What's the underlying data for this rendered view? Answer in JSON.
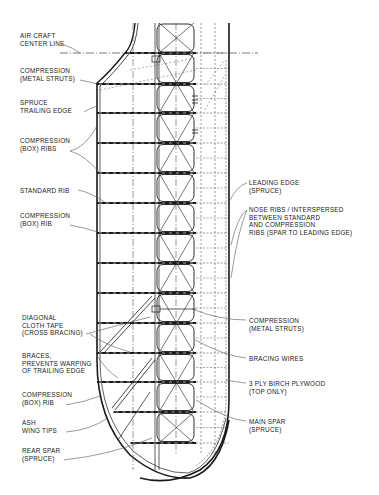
{
  "diagram": {
    "colors": {
      "ink": "#1a1a1a",
      "light_ink": "#555555",
      "background": "#ffffff"
    },
    "labels_left": [
      {
        "id": "aircraft-center-line",
        "text": "AIR CRAFT\nCENTER LINE",
        "x": 20,
        "y": 32
      },
      {
        "id": "compression-metal-struts-top",
        "text": "COMPRESSION\n(METAL STRUTS)",
        "x": 20,
        "y": 67
      },
      {
        "id": "spruce-trailing-edge",
        "text": "SPRUCE\nTRAILING EDGE",
        "x": 20,
        "y": 99
      },
      {
        "id": "compression-box-ribs",
        "text": "COMPRESSION\n(BOX) RIBS",
        "x": 20,
        "y": 137
      },
      {
        "id": "standard-rib",
        "text": "STANDARD RIB",
        "x": 20,
        "y": 187
      },
      {
        "id": "compression-box-rib-upper",
        "text": "COMPRESSION\n(BOX) RIB",
        "x": 20,
        "y": 212
      },
      {
        "id": "diagonal-cloth-tape",
        "text": "DIAGONAL\nCLOTH TAPE\n(CROSS BRACING)",
        "x": 22,
        "y": 314
      },
      {
        "id": "braces-trailing-edge",
        "text": "BRACES,\nPREVENTS WARPING\nOF TRAILING EDGE",
        "x": 22,
        "y": 352
      },
      {
        "id": "compression-box-rib-lower",
        "text": "COMPRESSION\n(BOX) RIB",
        "x": 22,
        "y": 391
      },
      {
        "id": "ash-wing-tips",
        "text": "ASH\nWING TIPS",
        "x": 22,
        "y": 419
      },
      {
        "id": "rear-spar",
        "text": "REAR SPAR\n(SPRUCE)",
        "x": 22,
        "y": 447
      }
    ],
    "labels_right": [
      {
        "id": "leading-edge",
        "text": "LEADING EDGE\n(SPRUCE)",
        "x": 249,
        "y": 179
      },
      {
        "id": "nose-ribs",
        "text": "NOSE RIBS / INTERSPERSED\nBETWEEN STANDARD\nAND COMPRESSION\nRIBS (SPAR TO LEADING EDGE)",
        "x": 249,
        "y": 206
      },
      {
        "id": "compression-metal-struts-bottom",
        "text": "COMPRESSION\n(METAL STRUTS)",
        "x": 249,
        "y": 317
      },
      {
        "id": "bracing-wires",
        "text": "BRACING WIRES",
        "x": 249,
        "y": 355
      },
      {
        "id": "birch-plywood",
        "text": "3 PLY BIRCH PLYWOOD\n(TOP ONLY)",
        "x": 249,
        "y": 380
      },
      {
        "id": "main-spar",
        "text": "MAIN SPAR\n(SPRUCE)",
        "x": 249,
        "y": 418
      }
    ],
    "ribs_y": [
      53,
      84,
      113,
      143,
      173,
      203,
      233,
      263,
      293,
      323,
      353,
      382,
      412,
      443
    ],
    "geometry": {
      "trailing_edge_x": 97,
      "rear_spar_x": 155,
      "main_spar_x": 196,
      "leading_edge_x": 229,
      "center_line_y": 53,
      "top_y": 23,
      "tip_bottom_y": 466
    }
  }
}
